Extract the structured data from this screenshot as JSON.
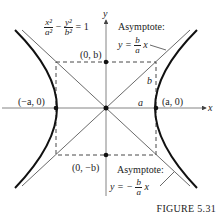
{
  "figure": {
    "caption": "FIGURE 5.31",
    "equation": {
      "x_num": "x²",
      "x_den": "a²",
      "minus": "−",
      "y_num": "y²",
      "y_den": "b²",
      "rhs": "= 1"
    },
    "axes": {
      "x_label": "x",
      "y_label": "y"
    },
    "points": {
      "top": "(0, b)",
      "bottom": "(0, −b)",
      "left": "(−a, 0)",
      "right": "(a, 0)"
    },
    "segment_labels": {
      "a": "a",
      "b": "b"
    },
    "asymptote_upper": {
      "title": "Asymptote:",
      "lhs": "y =",
      "num": "b",
      "den": "a",
      "var": "x"
    },
    "asymptote_lower": {
      "title": "Asymptote:",
      "lhs": "y = −",
      "num": "b",
      "den": "a",
      "var": "x"
    },
    "colors": {
      "curve": "#111111",
      "line": "#444444",
      "text": "#222222"
    }
  }
}
